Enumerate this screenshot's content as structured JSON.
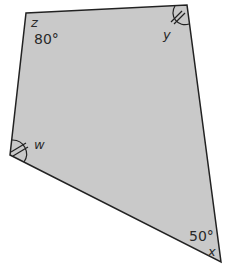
{
  "diagram": {
    "type": "quadrilateral",
    "fill_color": "#c9c9c9",
    "stroke_color": "#222222",
    "vertices": [
      {
        "name": "z",
        "angle_label": "80°"
      },
      {
        "name": "y",
        "angle_label": ""
      },
      {
        "name": "x",
        "angle_label": "50°"
      },
      {
        "name": "w",
        "angle_label": ""
      }
    ],
    "equal_angle_marks": [
      "y",
      "w"
    ]
  }
}
